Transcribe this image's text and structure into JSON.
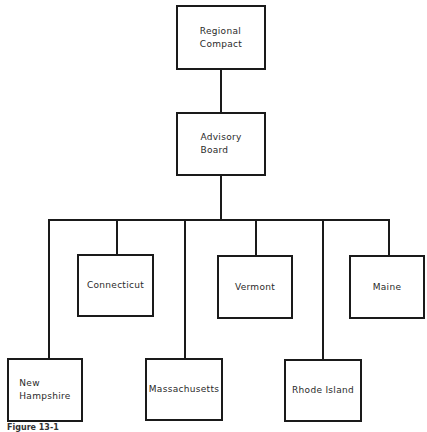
{
  "diagram": {
    "type": "org-chart",
    "root": {
      "label": "Regional\nCompact",
      "children": [
        {
          "label": "Advisory\nBoard",
          "children": [
            {
              "label": "New\nHampshire",
              "row": "lower"
            },
            {
              "label": "Connecticut",
              "row": "upper"
            },
            {
              "label": "Massachusetts",
              "row": "lower"
            },
            {
              "label": "Vermont",
              "row": "upper"
            },
            {
              "label": "Rhode Island",
              "row": "lower"
            },
            {
              "label": "Maine",
              "row": "upper"
            }
          ]
        }
      ]
    }
  },
  "nodes": {
    "regional_compact": "Regional\nCompact",
    "advisory_board": "Advisory\nBoard",
    "new_hampshire": "New\nHampshire",
    "connecticut": "Connecticut",
    "massachusetts": "Massachusetts",
    "vermont": "Vermont",
    "rhode_island": "Rhode Island",
    "maine": "Maine"
  },
  "caption": "Figure 13-1"
}
